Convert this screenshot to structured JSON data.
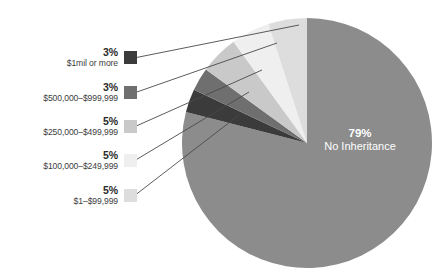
{
  "chart_data": {
    "type": "pie",
    "title": "",
    "subtitle": "",
    "xlabel": "",
    "ylabel": "",
    "grid": false,
    "legend_position": "left",
    "categories": [
      "No Inheritance",
      "$1mil or more",
      "$500,000–$999,999",
      "$250,000–$499,999",
      "$100,000–$249,999",
      "$1–$99,999"
    ],
    "values": [
      79,
      3,
      3,
      5,
      5,
      5
    ],
    "value_labels": [
      "79%",
      "3%",
      "3%",
      "5%",
      "5%",
      "5%"
    ],
    "colors": [
      "#8c8c8c",
      "#3b3b3b",
      "#6f6f6f",
      "#c9c9c9",
      "#efefef",
      "#dddddd"
    ],
    "slices": [
      {
        "name": "No Inheritance",
        "percent_label": "79%",
        "value": 79,
        "color": "#8c8c8c",
        "label_inside": true
      },
      {
        "name": "$1mil or more",
        "percent_label": "3%",
        "value": 3,
        "color": "#3b3b3b",
        "label_inside": false
      },
      {
        "name": "$500,000–$999,999",
        "percent_label": "3%",
        "value": 3,
        "color": "#6f6f6f",
        "label_inside": false
      },
      {
        "name": "$250,000–$499,999",
        "percent_label": "5%",
        "value": 5,
        "color": "#c9c9c9",
        "label_inside": false
      },
      {
        "name": "$100,000–$249,999",
        "percent_label": "5%",
        "value": 5,
        "color": "#efefef",
        "label_inside": false
      },
      {
        "name": "$1–$99,999",
        "percent_label": "5%",
        "value": 5,
        "color": "#dddddd",
        "label_inside": false
      }
    ]
  },
  "legend": {
    "items": [
      {
        "percent": "3%",
        "label": "$1mil or more",
        "color": "#3b3b3b"
      },
      {
        "percent": "3%",
        "label": "$500,000–$999,999",
        "color": "#6f6f6f"
      },
      {
        "percent": "5%",
        "label": "$250,000–$499,999",
        "color": "#c9c9c9"
      },
      {
        "percent": "5%",
        "label": "$100,000–$249,999",
        "color": "#efefef"
      },
      {
        "percent": "5%",
        "label": "$1–$99,999",
        "color": "#dddddd"
      }
    ]
  },
  "pie_center": {
    "percent": "79%",
    "label": "No Inheritance"
  },
  "style": {
    "background": "#ffffff",
    "leader_line_color": "#4a4a4a",
    "text_color": "#3d3d3d",
    "pct_color": "#2b2b2b",
    "inside_text_color": "#ffffff"
  }
}
